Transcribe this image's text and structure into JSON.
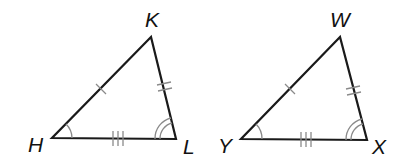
{
  "figure": {
    "colors": {
      "side": "#1a1a1a",
      "mark": "#8a8a8a",
      "label": "#111111",
      "background": "#ffffff"
    }
  },
  "triangles": [
    {
      "name": "HKL",
      "vertices": {
        "top": {
          "label": "K",
          "x": 151,
          "y": 37
        },
        "left": {
          "label": "H",
          "x": 52,
          "y": 138
        },
        "right": {
          "label": "L",
          "x": 176,
          "y": 139
        }
      },
      "side_marks": {
        "left_side": 1,
        "right_side": 2,
        "base": 3
      },
      "angle_marks": {
        "left": 1,
        "right": 2
      }
    },
    {
      "name": "YWX",
      "vertices": {
        "top": {
          "label": "W",
          "x": 340,
          "y": 37
        },
        "left": {
          "label": "Y",
          "x": 241,
          "y": 139
        },
        "right": {
          "label": "X",
          "x": 367,
          "y": 140
        }
      },
      "side_marks": {
        "left_side": 1,
        "right_side": 2,
        "base": 3
      },
      "angle_marks": {
        "left": 1,
        "right": 2
      }
    }
  ],
  "labels": {
    "K": "K",
    "H": "H",
    "L": "L",
    "W": "W",
    "Y": "Y",
    "X": "X"
  }
}
